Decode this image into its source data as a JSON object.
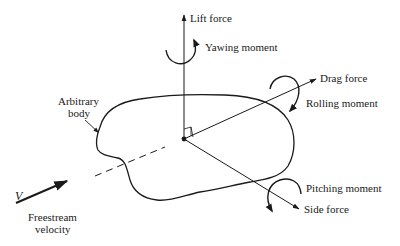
{
  "diagram": {
    "type": "aerodynamic-forces-and-moments",
    "center": [
      184,
      139
    ],
    "labels": {
      "lift_force": "Lift force",
      "yawing_moment": "Yawing moment",
      "drag_force": "Drag force",
      "rolling_moment": "Rolling moment",
      "pitching_moment": "Pitching moment",
      "side_force": "Side force",
      "arbitrary_body_line1": "Arbitrary",
      "arbitrary_body_line2": "body",
      "velocity_symbol": "V",
      "freestream_line1": "Freestream",
      "freestream_line2": "velocity"
    },
    "colors": {
      "ink": "#1a1a1a",
      "background": "#ffffff"
    }
  }
}
